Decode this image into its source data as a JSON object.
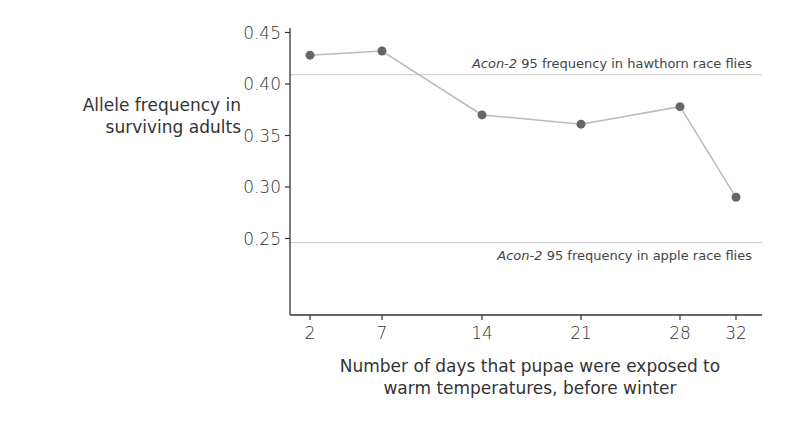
{
  "chart_data": {
    "type": "line",
    "title": "",
    "xlabel": "Number of days that pupae were exposed to warm temperatures, before winter",
    "xlabel_lines": [
      "Number of days that pupae were exposed to",
      "warm temperatures, before winter"
    ],
    "ylabel": "Allele frequency in surviving adults",
    "ylabel_lines": [
      "Allele frequency in",
      "surviving adults"
    ],
    "x": [
      2,
      7,
      14,
      21,
      28,
      32
    ],
    "x_tick_labels": [
      "2",
      "7",
      "14",
      "21",
      "28",
      "32"
    ],
    "y_tick_labels": [
      "0.45",
      "0.40",
      "0.35",
      "0.30",
      "0.25"
    ],
    "y_ticks": [
      0.45,
      0.4,
      0.35,
      0.3,
      0.25
    ],
    "ylim": [
      0.19,
      0.46
    ],
    "series": [
      {
        "name": "Acon-2 95 allele frequency",
        "values": [
          0.428,
          0.432,
          0.37,
          0.361,
          0.378,
          0.29
        ],
        "color": "#666666",
        "line_color": "#bbbbbb"
      }
    ],
    "reference_lines": [
      {
        "label_italic": "Acon-2",
        "label_rest": " 95 frequency in hawthorn race flies",
        "value": 0.409
      },
      {
        "label_italic": "Acon-2",
        "label_rest": " 95 frequency in apple race flies",
        "value": 0.246
      }
    ],
    "grid": false,
    "legend": null
  }
}
